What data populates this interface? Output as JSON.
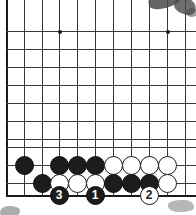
{
  "figure": {
    "board_type": "go-board",
    "visible_columns": 11,
    "visible_rows": 11,
    "line_spacing_px": 18,
    "colors": {
      "board_background": "#ffffff",
      "grid_line": "#3a3a3a",
      "edge_line": "#1a1a1a",
      "black_stone": "#1c1c1c",
      "white_stone": "#ffffff",
      "marker_text_on_black": "#ffffff",
      "marker_text_on_black_stone": "#1c1c1c"
    }
  },
  "grid": {
    "vertical_lines_x": [
      6,
      24,
      42,
      59,
      77,
      95,
      113,
      131,
      149,
      167,
      185
    ],
    "horizontal_lines_y": [
      31,
      49,
      67,
      85,
      103,
      121,
      139,
      147,
      165,
      183,
      195
    ],
    "left_edge_x": 6,
    "bottom_edge_y": 195,
    "star_points": [
      {
        "x": 59,
        "y": 31
      },
      {
        "x": 167,
        "y": 31
      }
    ]
  },
  "stones": [
    {
      "color": "black",
      "x": 24,
      "y": 165,
      "label": ""
    },
    {
      "color": "black",
      "x": 59,
      "y": 165,
      "label": ""
    },
    {
      "color": "black",
      "x": 77,
      "y": 165,
      "label": ""
    },
    {
      "color": "black",
      "x": 95,
      "y": 165,
      "label": ""
    },
    {
      "color": "white",
      "x": 113,
      "y": 165,
      "label": ""
    },
    {
      "color": "white",
      "x": 131,
      "y": 165,
      "label": ""
    },
    {
      "color": "white",
      "x": 149,
      "y": 165,
      "label": ""
    },
    {
      "color": "white",
      "x": 167,
      "y": 165,
      "label": ""
    },
    {
      "color": "black",
      "x": 42,
      "y": 183,
      "label": ""
    },
    {
      "color": "white",
      "x": 59,
      "y": 183,
      "label": ""
    },
    {
      "color": "white",
      "x": 77,
      "y": 183,
      "label": ""
    },
    {
      "color": "white",
      "x": 95,
      "y": 183,
      "label": ""
    },
    {
      "color": "black",
      "x": 113,
      "y": 183,
      "label": ""
    },
    {
      "color": "black",
      "x": 131,
      "y": 183,
      "label": ""
    },
    {
      "color": "black",
      "x": 149,
      "y": 183,
      "label": ""
    },
    {
      "color": "white",
      "x": 167,
      "y": 183,
      "label": ""
    }
  ],
  "move_markers": [
    {
      "number": "3",
      "color": "black",
      "x": 59,
      "y": 195
    },
    {
      "number": "1",
      "color": "black",
      "x": 95,
      "y": 195
    },
    {
      "number": "2",
      "color": "white",
      "x": 149,
      "y": 195
    }
  ],
  "artifacts": {
    "description": "scanned page smudges",
    "count": 5
  }
}
